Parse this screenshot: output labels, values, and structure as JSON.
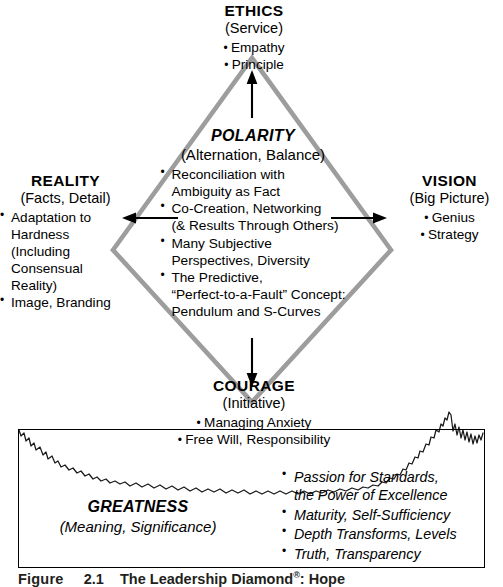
{
  "figure": {
    "caption_prefix": "Figure",
    "caption_number": "2.1",
    "caption_text": "The Leadership Diamond",
    "caption_mark": "®",
    "caption_suffix": ": Hope",
    "diamond_color": "#9d9d9d",
    "line_color": "#000000",
    "text_color": "#000000"
  },
  "ethics": {
    "heading": "ETHICS",
    "subtitle": "(Service)",
    "bullets": [
      "Empathy",
      "Principle"
    ]
  },
  "polarity": {
    "heading": "POLARITY",
    "subtitle": "(Alternation, Balance)",
    "bullets": [
      {
        "line1": "Reconciliation with",
        "line2": "Ambiguity as Fact"
      },
      {
        "line1": "Co-Creation, Networking",
        "line2": "(& Results Through Others)"
      },
      {
        "line1": "Many Subjective",
        "line2": "Perspectives, Diversity"
      },
      {
        "line1": "The Predictive,",
        "line2": "“Perfect-to-a-Fault” Concept:",
        "line3": "Pendulum and S-Curves"
      }
    ]
  },
  "reality": {
    "heading": "REALITY",
    "subtitle": "(Facts, Detail)",
    "bullets": [
      {
        "line1": "Adaptation to",
        "line2": "Hardness (Including",
        "line3": "Consensual Reality)"
      },
      {
        "line1": "Image, Branding"
      }
    ]
  },
  "vision": {
    "heading": "VISION",
    "subtitle": "(Big Picture)",
    "bullets": [
      "Genius",
      "Strategy"
    ]
  },
  "courage": {
    "heading": "COURAGE",
    "subtitle": "(Initiative)",
    "bullets": [
      "Managing Anxiety",
      "Free Will, Responsibility"
    ]
  },
  "greatness": {
    "heading": "GREATNESS",
    "subtitle": "(Meaning, Significance)",
    "bullets": [
      {
        "line1": "Passion for Standards,",
        "line2": "the Power of Excellence"
      },
      {
        "line1": "Maturity, Self-Sufficiency"
      },
      {
        "line1": "Depth Transforms, Levels"
      },
      {
        "line1": "Truth, Transparency"
      }
    ]
  },
  "arrows": {
    "up": "arrow-up",
    "down": "arrow-down",
    "left": "arrow-left",
    "right": "arrow-right"
  }
}
